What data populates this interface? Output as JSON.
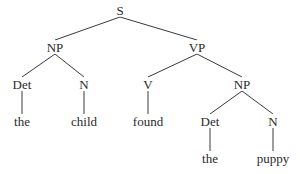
{
  "diagram": {
    "type": "parse-tree",
    "sentence": "the child found the puppy",
    "nodes": [
      {
        "id": "s",
        "label": "S",
        "x": 120,
        "y": 10
      },
      {
        "id": "np1",
        "label": "NP",
        "x": 55,
        "y": 47
      },
      {
        "id": "vp",
        "label": "VP",
        "x": 197,
        "y": 47
      },
      {
        "id": "det1",
        "label": "Det",
        "x": 22,
        "y": 84
      },
      {
        "id": "n1",
        "label": "N",
        "x": 84,
        "y": 84
      },
      {
        "id": "v",
        "label": "V",
        "x": 148,
        "y": 84
      },
      {
        "id": "np2",
        "label": "NP",
        "x": 242,
        "y": 84
      },
      {
        "id": "w_the1",
        "label": "the",
        "x": 22,
        "y": 121
      },
      {
        "id": "w_child",
        "label": "child",
        "x": 84,
        "y": 121
      },
      {
        "id": "w_found",
        "label": "found",
        "x": 148,
        "y": 121
      },
      {
        "id": "det2",
        "label": "Det",
        "x": 210,
        "y": 121
      },
      {
        "id": "n2",
        "label": "N",
        "x": 273,
        "y": 121
      },
      {
        "id": "w_the2",
        "label": "the",
        "x": 210,
        "y": 158
      },
      {
        "id": "w_puppy",
        "label": "puppy",
        "x": 273,
        "y": 158
      }
    ],
    "edges": [
      [
        "s",
        "np1"
      ],
      [
        "s",
        "vp"
      ],
      [
        "np1",
        "det1"
      ],
      [
        "np1",
        "n1"
      ],
      [
        "vp",
        "v"
      ],
      [
        "vp",
        "np2"
      ],
      [
        "det1",
        "w_the1"
      ],
      [
        "n1",
        "w_child"
      ],
      [
        "v",
        "w_found"
      ],
      [
        "np2",
        "det2"
      ],
      [
        "np2",
        "n2"
      ],
      [
        "det2",
        "w_the2"
      ],
      [
        "n2",
        "w_puppy"
      ]
    ]
  }
}
